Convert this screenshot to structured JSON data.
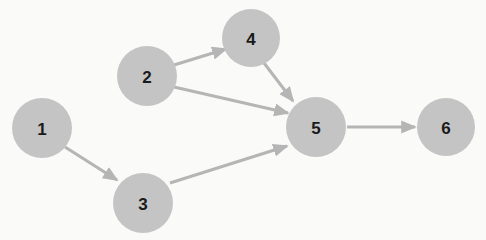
{
  "diagram": {
    "type": "directed-graph",
    "width": 486,
    "height": 240,
    "background_color": "#fafaf9",
    "node_fill_color": "#c4c4c4",
    "node_label_color": "#1a1a1a",
    "edge_color": "#b5b5b5",
    "edge_width": 3,
    "nodes": [
      {
        "id": "1",
        "label": "1",
        "cx": 42,
        "cy": 128,
        "r": 30
      },
      {
        "id": "2",
        "label": "2",
        "cx": 147,
        "cy": 76,
        "r": 30
      },
      {
        "id": "3",
        "label": "3",
        "cx": 143,
        "cy": 203,
        "r": 30
      },
      {
        "id": "4",
        "label": "4",
        "cx": 251,
        "cy": 38,
        "r": 29
      },
      {
        "id": "5",
        "label": "5",
        "cx": 316,
        "cy": 127,
        "r": 30
      },
      {
        "id": "6",
        "label": "6",
        "cx": 446,
        "cy": 127,
        "r": 29
      }
    ],
    "edges": [
      {
        "id": "e1",
        "from": "1",
        "to": "3",
        "label": "",
        "x1": 65,
        "y1": 147,
        "x2": 117,
        "y2": 180
      },
      {
        "id": "e2",
        "from": "2",
        "to": "4",
        "label": "",
        "x1": 174,
        "y1": 65,
        "x2": 226,
        "y2": 49
      },
      {
        "id": "e3",
        "from": "2",
        "to": "5",
        "label": "",
        "x1": 174,
        "y1": 87,
        "x2": 288,
        "y2": 113
      },
      {
        "id": "e4",
        "from": "4",
        "to": "5",
        "label": "",
        "x1": 264,
        "y1": 63,
        "x2": 293,
        "y2": 101
      },
      {
        "id": "e5",
        "from": "3",
        "to": "5",
        "label": "",
        "x1": 170,
        "y1": 183,
        "x2": 287,
        "y2": 146
      },
      {
        "id": "e6",
        "from": "5",
        "to": "6",
        "label": "",
        "x1": 347,
        "y1": 127,
        "x2": 415,
        "y2": 127
      }
    ]
  }
}
